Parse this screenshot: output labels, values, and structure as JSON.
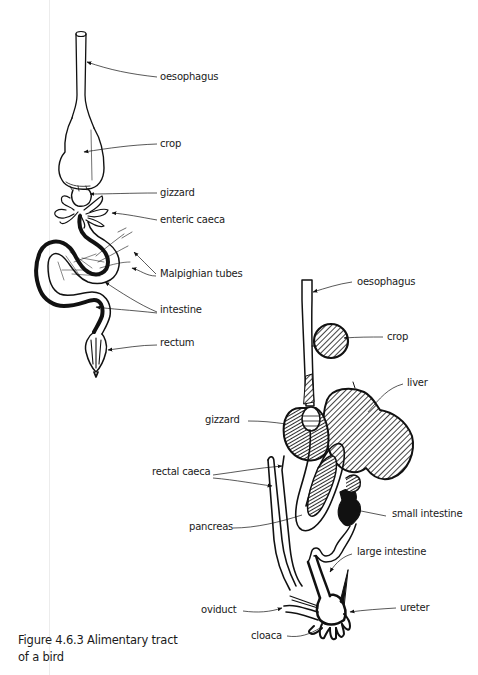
{
  "figure": {
    "caption_line1": "Figure 4.6.3  Alimentary tract",
    "caption_line2": "of a bird"
  },
  "insect_diagram": {
    "labels": {
      "oesophagus": "oesophagus",
      "crop": "crop",
      "gizzard": "gizzard",
      "enteric_caeca": "enteric caeca",
      "malpighian_tubes": "Malpighian tubes",
      "intestine": "intestine",
      "rectum": "rectum"
    }
  },
  "bird_diagram": {
    "labels": {
      "oesophagus": "oesophagus",
      "crop": "crop",
      "liver": "liver",
      "gizzard": "gizzard",
      "rectal_caeca": "rectal caeca",
      "small_intestine": "small intestine",
      "pancreas": "pancreas",
      "large_intestine": "large intestine",
      "oviduct": "oviduct",
      "ureter": "ureter",
      "cloaca": "cloaca"
    }
  },
  "colors": {
    "ink": "#111111",
    "background": "#ffffff",
    "margin_line": "#ececec"
  }
}
